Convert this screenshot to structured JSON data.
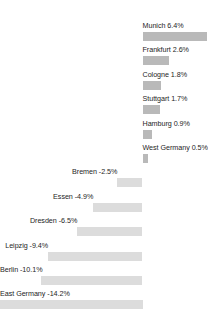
{
  "chart_data": {
    "type": "bar",
    "orientation": "horizontal",
    "title": "",
    "subtitle": "",
    "xlabel": "",
    "ylabel": "",
    "grid": false,
    "legend": null,
    "axis_visible": false,
    "tick_labels": [],
    "value_suffix": "%",
    "zero_baseline": 0,
    "xlim": [
      -14.2,
      6.4
    ],
    "categories": [
      "Munich",
      "Frankfurt",
      "Cologne",
      "Stuttgart",
      "Hamburg",
      "West Germany",
      "Bremen",
      "Essen",
      "Dresden",
      "Leipzig",
      "Berlin",
      "East Germany"
    ],
    "values": [
      6.4,
      2.6,
      1.8,
      1.7,
      0.9,
      0.5,
      -2.5,
      -4.9,
      -6.5,
      -9.4,
      -10.1,
      -14.2
    ],
    "annotations": [
      "Munich 6.4%",
      "Frankfurt 2.6%",
      "Cologne 1.8%",
      "Stuttgart 1.7%",
      "Hamburg 0.9%",
      "West Germany 0.5%",
      "Bremen -2.5%",
      "Essen -4.9%",
      "Dresden -6.5%",
      "Leipzig -9.4%",
      "Berlin -10.1%",
      "East Germany -14.2%"
    ],
    "colors": {
      "positive_bar": "#b9b9b9",
      "negative_bar": "#dcdcdc",
      "label_text": "#252525",
      "background": "#ffffff"
    }
  },
  "bars": [
    {
      "label": "Munich 6.4%",
      "name": "Munich",
      "value": 6.4
    },
    {
      "label": "Frankfurt 2.6%",
      "name": "Frankfurt",
      "value": 2.6
    },
    {
      "label": "Cologne 1.8%",
      "name": "Cologne",
      "value": 1.8
    },
    {
      "label": "Stuttgart 1.7%",
      "name": "Stuttgart",
      "value": 1.7
    },
    {
      "label": "Hamburg 0.9%",
      "name": "Hamburg",
      "value": 0.9
    },
    {
      "label": "West Germany 0.5%",
      "name": "West Germany",
      "value": 0.5
    },
    {
      "label": "Bremen -2.5%",
      "name": "Bremen",
      "value": -2.5
    },
    {
      "label": "Essen -4.9%",
      "name": "Essen",
      "value": -4.9
    },
    {
      "label": "Dresden -6.5%",
      "name": "Dresden",
      "value": -6.5
    },
    {
      "label": "Leipzig -9.4%",
      "name": "Leipzig",
      "value": -9.4
    },
    {
      "label": "Berlin -10.1%",
      "name": "Berlin",
      "value": -10.1
    },
    {
      "label": "East Germany -14.2%",
      "name": "East Germany",
      "value": -14.2
    }
  ]
}
